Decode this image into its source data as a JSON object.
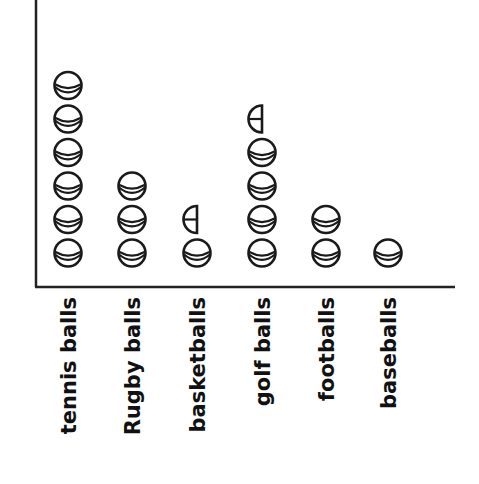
{
  "chart_data": {
    "type": "pictograph",
    "title": "",
    "xlabel": "",
    "ylabel": "",
    "categories": [
      "tennis balls",
      "Rugby balls",
      "basketballs",
      "golf balls",
      "footballs",
      "baseballs"
    ],
    "values": [
      6,
      3,
      1.5,
      4.5,
      2,
      1
    ],
    "symbol": "ball",
    "half_symbol": "left-half ball",
    "grid": false,
    "legend": null,
    "colors": {
      "ink": "#1a1a1a",
      "background": "#ffffff"
    }
  },
  "layout": {
    "y_axis_x": 36,
    "x_axis_y": 287,
    "x_axis_end": 455,
    "column_x": [
      68,
      132,
      197,
      262,
      326,
      388
    ],
    "ball_radius": 13.5,
    "ball_spacing": 33.5,
    "first_ball_cy": 253,
    "label_top": 297
  }
}
